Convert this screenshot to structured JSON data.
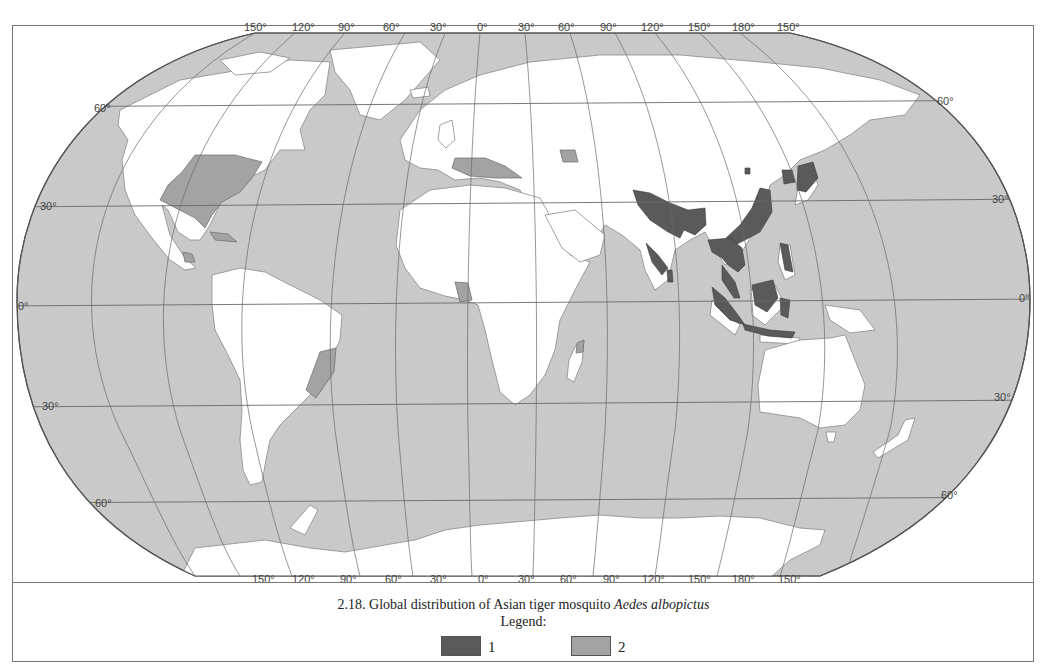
{
  "map": {
    "projection": "Robinson",
    "longitude_labels_top": [
      "150°",
      "120°",
      "90°",
      "60°",
      "30°",
      "0°",
      "30°",
      "60°",
      "90°",
      "120°",
      "150°",
      "180°",
      "150°"
    ],
    "longitude_labels_bottom": [
      "150°",
      "120°",
      "90°",
      "60°",
      "30°",
      "0°",
      "30°",
      "60°",
      "90°",
      "120°",
      "150°",
      "180°",
      "150°"
    ],
    "latitude_labels_left": [
      "60°",
      "30°",
      "0°",
      "30°",
      "60°"
    ],
    "latitude_labels_right": [
      "60°",
      "30°",
      "0°",
      "30°",
      "60°"
    ],
    "colors": {
      "ocean": "#c9c9c9",
      "land": "#ffffff",
      "category_1": "#5a5a5a",
      "category_2": "#a3a3a3",
      "graticule": "#6a6a6a",
      "border": "#8a8a8a"
    },
    "category_1_regions": [
      "South and Southeast Asia (India, Bangladesh, Indochina)",
      "Southern and eastern China",
      "Japan and Korea",
      "Indonesia, Borneo, Philippines",
      "Sri Lanka"
    ],
    "category_2_regions": [
      "Eastern United States",
      "Central America",
      "Caribbean (Cuba)",
      "Southeastern Brazil",
      "Mediterranean Europe",
      "Cameroon / Equatorial Guinea",
      "Madagascar (north)",
      "Caucasus region"
    ]
  },
  "caption": {
    "number": "2.18.",
    "text": "Global distribution of Asian tiger mosquito",
    "species": "Aedes albopictus"
  },
  "legend": {
    "title": "Legend:",
    "items": [
      {
        "label": "1",
        "color": "#5a5a5a"
      },
      {
        "label": "2",
        "color": "#a3a3a3"
      }
    ]
  }
}
